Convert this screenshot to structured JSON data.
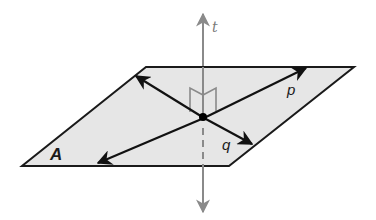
{
  "figure": {
    "type": "geometry",
    "colors": {
      "plane_fill": "#e6e6e6",
      "plane_edge": "#1a1a1a",
      "lines_in_plane": "#111111",
      "perpendicular_line": "#8a8a8a",
      "right_angle_marks": "#8a8a8a",
      "point": "#000000"
    },
    "plane": {
      "label": "A",
      "vertices": [
        [
          146,
          67
        ],
        [
          354,
          67
        ],
        [
          229,
          166
        ],
        [
          22,
          166
        ]
      ]
    },
    "intersection_point": [
      204,
      118
    ],
    "lines": [
      {
        "name": "t",
        "label": "t",
        "from": [
          203,
          14
        ],
        "to": [
          203,
          212
        ],
        "style": "gray",
        "hidden_segment": [
          [
            203,
            130
          ],
          [
            203,
            166
          ]
        ]
      },
      {
        "name": "p",
        "label": "p",
        "from": [
          97,
          163
        ],
        "to": [
          307,
          67
        ]
      },
      {
        "name": "q",
        "label": "q",
        "from": [
          135,
          75
        ],
        "to": [
          253,
          144
        ]
      }
    ],
    "labels": {
      "t": "t",
      "p": "p",
      "q": "q",
      "A": "A"
    }
  }
}
